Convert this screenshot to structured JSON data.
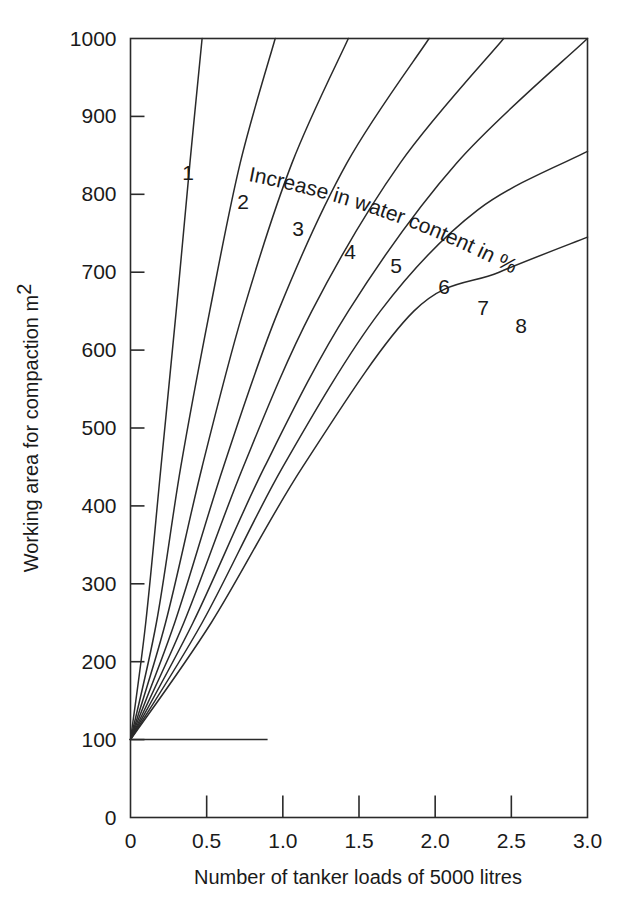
{
  "chart_data": {
    "type": "line",
    "title": "",
    "subtitle": "",
    "xlabel": "Number of tanker loads of 5000 litres",
    "ylabel": "Working area for compaction m2",
    "ylabel_base": "Working area for compaction m",
    "ylabel_sup": "2",
    "xlim": [
      0,
      3.0
    ],
    "ylim": [
      0,
      1000
    ],
    "xticks": [
      0,
      0.5,
      1.0,
      1.5,
      2.0,
      2.5,
      3.0
    ],
    "xticklabels": [
      "0",
      "0.5",
      "1.0",
      "1.5",
      "2.0",
      "2.5",
      "3.0"
    ],
    "yticks": [
      0,
      100,
      200,
      300,
      400,
      500,
      600,
      700,
      800,
      900,
      1000
    ],
    "yticklabels": [
      "0",
      "100",
      "200",
      "300",
      "400",
      "500",
      "600",
      "700",
      "800",
      "900",
      "1000"
    ],
    "grid": false,
    "legend": "none",
    "annotation": "Increase in water content in %",
    "annotation_label": "Increase in water content in %",
    "origin_point": {
      "x": 0.0,
      "y": 100
    },
    "baseline_segment": {
      "y": 100,
      "x_start": 0.0,
      "x_end": 0.9
    },
    "series": [
      {
        "name": "1",
        "label": "1",
        "water_content_percent": 1,
        "end_point": {
          "x": 0.47,
          "y": 1000
        },
        "points": [
          [
            0.0,
            100
          ],
          [
            0.1,
            250
          ],
          [
            0.2,
            450
          ],
          [
            0.3,
            650
          ],
          [
            0.39,
            840
          ],
          [
            0.47,
            1000
          ]
        ]
      },
      {
        "name": "2",
        "label": "2",
        "water_content_percent": 2,
        "end_point": {
          "x": 0.95,
          "y": 1000
        },
        "points": [
          [
            0.0,
            100
          ],
          [
            0.17,
            250
          ],
          [
            0.33,
            450
          ],
          [
            0.52,
            650
          ],
          [
            0.72,
            840
          ],
          [
            0.95,
            1000
          ]
        ]
      },
      {
        "name": "3",
        "label": "3",
        "water_content_percent": 3,
        "end_point": {
          "x": 1.43,
          "y": 1000
        },
        "points": [
          [
            0.0,
            100
          ],
          [
            0.23,
            250
          ],
          [
            0.47,
            450
          ],
          [
            0.74,
            650
          ],
          [
            1.06,
            840
          ],
          [
            1.43,
            1000
          ]
        ]
      },
      {
        "name": "4",
        "label": "4",
        "water_content_percent": 4,
        "end_point": {
          "x": 1.96,
          "y": 1000
        },
        "points": [
          [
            0.0,
            100
          ],
          [
            0.29,
            250
          ],
          [
            0.61,
            450
          ],
          [
            0.97,
            650
          ],
          [
            1.42,
            840
          ],
          [
            1.96,
            1000
          ]
        ]
      },
      {
        "name": "5",
        "label": "5",
        "water_content_percent": 5,
        "end_point": {
          "x": 2.45,
          "y": 1000
        },
        "points": [
          [
            0.0,
            100
          ],
          [
            0.35,
            250
          ],
          [
            0.74,
            450
          ],
          [
            1.19,
            650
          ],
          [
            1.77,
            840
          ],
          [
            2.45,
            1000
          ]
        ]
      },
      {
        "name": "6",
        "label": "6",
        "water_content_percent": 6,
        "end_point": {
          "x": 3.0,
          "y": 1000
        },
        "points": [
          [
            0.0,
            100
          ],
          [
            0.41,
            250
          ],
          [
            0.88,
            450
          ],
          [
            1.43,
            650
          ],
          [
            2.14,
            840
          ],
          [
            3.0,
            1000
          ]
        ]
      },
      {
        "name": "7",
        "label": "7",
        "water_content_percent": 7,
        "end_point": {
          "x": 3.0,
          "y": 855
        },
        "points": [
          [
            0.0,
            100
          ],
          [
            0.47,
            250
          ],
          [
            1.0,
            450
          ],
          [
            1.64,
            650
          ],
          [
            2.28,
            780
          ],
          [
            3.0,
            855
          ]
        ]
      },
      {
        "name": "8",
        "label": "8",
        "water_content_percent": 8,
        "end_point": {
          "x": 3.0,
          "y": 745
        },
        "points": [
          [
            0.0,
            100
          ],
          [
            0.53,
            250
          ],
          [
            1.13,
            450
          ],
          [
            1.86,
            650
          ],
          [
            2.42,
            700
          ],
          [
            3.0,
            745
          ]
        ]
      }
    ]
  }
}
